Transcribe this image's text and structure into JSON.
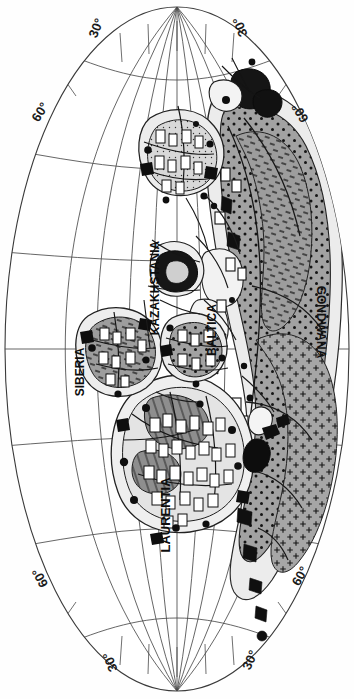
{
  "figure": {
    "kind": "paleogeographic-world-map",
    "projection": "elliptical (Mollweide-style) global projection, image rotated 90°",
    "background_color": "#ffffff",
    "line_color": "#2b2b2b",
    "land_fill": "#9a9a9a",
    "shelf_fill": "#e8e8e8",
    "feature_fill": "#111111",
    "symbol_stroke": "#1a1a1a"
  },
  "graticule": {
    "labels": [
      {
        "id": "lat-30-top-left",
        "text": "30°",
        "x": 96,
        "y": 28,
        "rot": -68
      },
      {
        "id": "lat-30-top-right",
        "text": "30°",
        "x": 240,
        "y": 27,
        "rot": -112
      },
      {
        "id": "lat-60-upper-left",
        "text": "60°",
        "x": 40,
        "y": 112,
        "rot": -58
      },
      {
        "id": "lat-60-upper-right",
        "text": "60°",
        "x": 300,
        "y": 113,
        "rot": -122
      },
      {
        "id": "lat-60-lower-left",
        "text": "60°",
        "x": 40,
        "y": 578,
        "rot": -118
      },
      {
        "id": "lat-60-lower-right",
        "text": "60°",
        "x": 300,
        "y": 576,
        "rot": -60
      },
      {
        "id": "lat-30-bottom-left",
        "text": "30°",
        "x": 110,
        "y": 662,
        "rot": -112
      },
      {
        "id": "lat-30-bottom-right",
        "text": "30°",
        "x": 250,
        "y": 660,
        "rot": -66
      }
    ],
    "meridian_count": 9,
    "parallel_count": 7,
    "grid_visible": true
  },
  "cratons": [
    {
      "id": "laurentia",
      "text": "LAURENTIA",
      "x": 165,
      "y": 515,
      "rot": -90,
      "size": 13
    },
    {
      "id": "siberia",
      "text": "SIBERIA",
      "x": 80,
      "y": 372,
      "rot": -90,
      "size": 12
    },
    {
      "id": "kazakhstania",
      "text": "KAZAKHSTANIA",
      "x": 155,
      "y": 288,
      "rot": -90,
      "size": 12
    },
    {
      "id": "baltica",
      "text": "BALTICA",
      "x": 212,
      "y": 330,
      "rot": -90,
      "size": 12
    },
    {
      "id": "gondwana",
      "text": "GONDWANA",
      "x": 321,
      "y": 322,
      "rot": 90,
      "size": 12
    }
  ],
  "legend_symbols": {
    "land_pattern": "stippled-gray",
    "shelf_pattern": "plain-light",
    "basin_symbol": "open-rectangle",
    "deposit_symbol": "filled-black-blob",
    "cross_pattern": "plus-ticks",
    "dash_pattern": "short-dashes",
    "dot_pattern": "round-dots"
  }
}
